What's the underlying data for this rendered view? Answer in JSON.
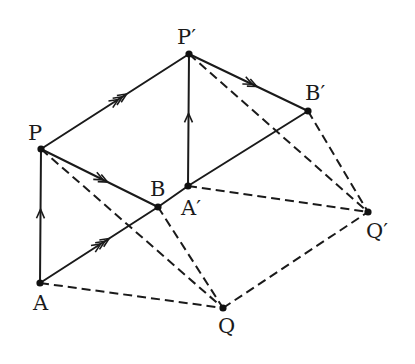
{
  "diagram": {
    "points": [
      {
        "id": "P",
        "label": "P"
      },
      {
        "id": "P'",
        "label": "P′"
      },
      {
        "id": "B",
        "label": "B"
      },
      {
        "id": "A'",
        "label": "A′"
      },
      {
        "id": "B'",
        "label": "B′"
      },
      {
        "id": "A",
        "label": "A"
      },
      {
        "id": "Q",
        "label": "Q"
      },
      {
        "id": "Q'",
        "label": "Q′"
      }
    ],
    "solid_edges": [
      {
        "from": "P",
        "to": "P'",
        "arrow": "triple"
      },
      {
        "from": "P",
        "to": "B",
        "arrow": "double"
      },
      {
        "from": "A",
        "to": "P",
        "arrow": "single"
      },
      {
        "from": "A",
        "to": "B",
        "arrow": "triple"
      },
      {
        "from": "B",
        "to": "A'",
        "arrow": "none"
      },
      {
        "from": "A'",
        "to": "P'",
        "arrow": "single"
      },
      {
        "from": "P'",
        "to": "B'",
        "arrow": "double"
      },
      {
        "from": "A'",
        "to": "B'",
        "arrow": "none"
      }
    ],
    "dashed_edges": [
      {
        "from": "P",
        "to": "Q"
      },
      {
        "from": "B",
        "to": "Q"
      },
      {
        "from": "A",
        "to": "Q"
      },
      {
        "from": "Q",
        "to": "Q'"
      },
      {
        "from": "A'",
        "to": "Q'"
      },
      {
        "from": "P'",
        "to": "Q'"
      },
      {
        "from": "B'",
        "to": "Q'"
      }
    ]
  }
}
